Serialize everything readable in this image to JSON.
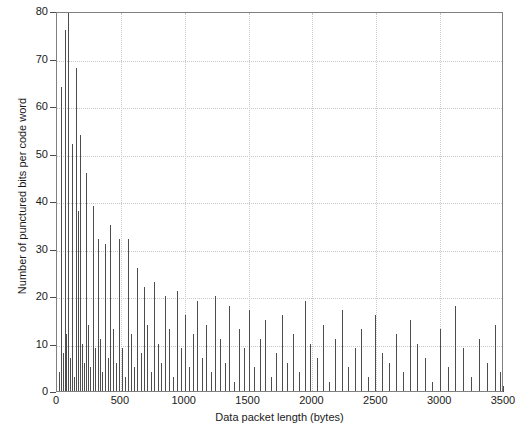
{
  "chart_data": {
    "type": "bar",
    "title": "",
    "subtitle": "",
    "xlabel": "Data packet length (bytes)",
    "ylabel": "Number of punctured bits per code word",
    "xlim": [
      0,
      3500
    ],
    "ylim": [
      0,
      80
    ],
    "xticks": [
      0,
      500,
      1000,
      1500,
      2000,
      2500,
      3000,
      3500
    ],
    "yticks": [
      0,
      10,
      20,
      30,
      40,
      50,
      60,
      70,
      80
    ],
    "xtick_labels": [
      "0",
      "500",
      "1000",
      "1500",
      "2000",
      "2500",
      "3000",
      "3500"
    ],
    "ytick_labels": [
      "0",
      "10",
      "20",
      "30",
      "40",
      "50",
      "60",
      "70",
      "80"
    ],
    "grid": true,
    "grid_style": "dotted",
    "legend": "none",
    "series_color": "#4d4d4d",
    "series_name": "punctured bits per code word",
    "x": [
      18,
      32,
      46,
      60,
      74,
      88,
      102,
      116,
      130,
      148,
      162,
      178,
      196,
      212,
      228,
      246,
      262,
      280,
      300,
      318,
      336,
      356,
      376,
      396,
      418,
      440,
      462,
      484,
      506,
      530,
      554,
      578,
      602,
      628,
      654,
      680,
      706,
      734,
      762,
      790,
      818,
      848,
      878,
      908,
      938,
      970,
      1002,
      1034,
      1066,
      1100,
      1134,
      1168,
      1204,
      1240,
      1276,
      1312,
      1350,
      1388,
      1426,
      1466,
      1506,
      1546,
      1588,
      1630,
      1672,
      1714,
      1758,
      1802,
      1846,
      1892,
      1938,
      1984,
      2032,
      2080,
      2128,
      2178,
      2228,
      2278,
      2330,
      2382,
      2434,
      2488,
      2542,
      2596,
      2652,
      2708,
      2764,
      2822,
      2880,
      2938,
      2998,
      3058,
      3118,
      3180,
      3242,
      3304,
      3368,
      3432,
      3470,
      3496
    ],
    "values": [
      4,
      64,
      8,
      76,
      12,
      80,
      7,
      52,
      3,
      68,
      38,
      54,
      10,
      6,
      46,
      14,
      5,
      39,
      9,
      32,
      11,
      4,
      31,
      7,
      35,
      13,
      6,
      32,
      9,
      3,
      32,
      12,
      5,
      26,
      8,
      22,
      14,
      4,
      23,
      10,
      6,
      20,
      13,
      3,
      21,
      9,
      16,
      5,
      12,
      19,
      7,
      14,
      4,
      20,
      11,
      6,
      18,
      2,
      13,
      9,
      17,
      5,
      11,
      15,
      3,
      8,
      16,
      6,
      12,
      4,
      19,
      10,
      7,
      14,
      2,
      11,
      17,
      5,
      9,
      13,
      3,
      16,
      8,
      6,
      12,
      4,
      15,
      10,
      7,
      2,
      13,
      5,
      18,
      9,
      3,
      11,
      6,
      14,
      4,
      18
    ]
  }
}
